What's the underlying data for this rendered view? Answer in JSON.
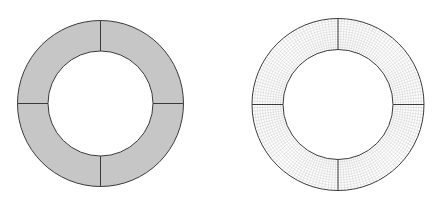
{
  "figure": {
    "colors": {
      "background": "#ffffff",
      "outline": "#3a3a3a",
      "solid_fill": "#c6c6c6",
      "mesh_line": "#cfcfcf"
    },
    "rings": [
      {
        "id": "geometry-ring",
        "style": "solid",
        "cx": 100.5,
        "cy": 103.5,
        "outer_r": 83,
        "inner_r": 52.5,
        "sections": 4
      },
      {
        "id": "mesh-ring",
        "style": "mesh",
        "cx": 338,
        "cy": 104.5,
        "outer_r": 86,
        "inner_r": 55,
        "sections": 4,
        "mesh_radial_divisions": 160,
        "mesh_ring_divisions": 12
      }
    ]
  }
}
